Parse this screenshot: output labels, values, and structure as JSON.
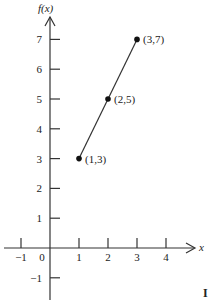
{
  "chart_data": {
    "type": "line",
    "title": "",
    "xlabel": "x",
    "ylabel": "f(x)",
    "x": [
      1,
      2,
      3
    ],
    "series": [
      {
        "name": "f(x)",
        "values": [
          3,
          5,
          7
        ]
      }
    ],
    "points": [
      {
        "x": 1,
        "y": 3,
        "label": "(1,3)"
      },
      {
        "x": 2,
        "y": 5,
        "label": "(2,5)"
      },
      {
        "x": 3,
        "y": 7,
        "label": "(3,7)"
      }
    ],
    "x_ticks": [
      "-1",
      "0",
      "1",
      "2",
      "3",
      "4"
    ],
    "y_ticks": [
      "-1",
      "1",
      "2",
      "3",
      "4",
      "5",
      "6",
      "7"
    ],
    "xlim": [
      -1.5,
      4.8
    ],
    "ylim": [
      -1.7,
      8.3
    ],
    "grid": false,
    "legend": "none",
    "corner_mark": "I"
  }
}
